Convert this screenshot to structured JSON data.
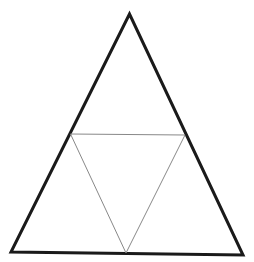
{
  "diagram": {
    "background": "#ffffff",
    "outer_triangle": {
      "points": [
        [
          129.5,
          14
        ],
        [
          11,
          252
        ],
        [
          243,
          255
        ]
      ],
      "stroke": "#1a1a1a",
      "stroke_width": 3
    },
    "inner_triangle": {
      "points": [
        [
          70.5,
          134
        ],
        [
          185,
          135
        ],
        [
          126,
          253
        ]
      ],
      "stroke": "#888888",
      "stroke_width": 1
    }
  }
}
